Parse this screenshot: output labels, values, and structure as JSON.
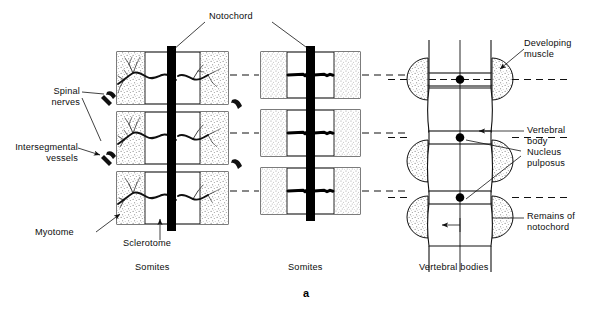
{
  "figure": {
    "letter": "a",
    "title_labels": {
      "notochord": "Notochord",
      "spinal_nerves": "Spinal\nnerves",
      "intersegmental_vessels": "Intersegmental\nvessels",
      "myotome": "Myotome",
      "sclerotome": "Sclerotome",
      "developing_muscle": "Developing\nmuscle",
      "vertebral_body": "Vertebral\nbody",
      "nucleus_pulposus": "Nucleus\npulposus",
      "remains_of_notochord": "Remains of\nnotochord"
    },
    "panel_captions": {
      "left": "Somites",
      "middle": "Somites",
      "right": "Vertebral bodies"
    },
    "colors": {
      "ink": "#111111",
      "notochord_fill": "#000000",
      "stipple": "#9a9a9a",
      "paper": "#ffffff"
    },
    "panels": [
      {
        "name": "left-somites",
        "caption": "Somites",
        "rows": 3,
        "features": [
          "myotome",
          "sclerotome",
          "spinal-nerves",
          "intersegmental-vessels",
          "notochord"
        ]
      },
      {
        "name": "middle-somites",
        "caption": "Somites",
        "rows": 3,
        "features": [
          "sclerotome-condensation",
          "notochord"
        ]
      },
      {
        "name": "right-vertebral-bodies",
        "caption": "Vertebral bodies",
        "rows": 3,
        "features": [
          "developing-muscle",
          "vertebral-body",
          "nucleus-pulposus",
          "remains-of-notochord"
        ]
      }
    ]
  }
}
